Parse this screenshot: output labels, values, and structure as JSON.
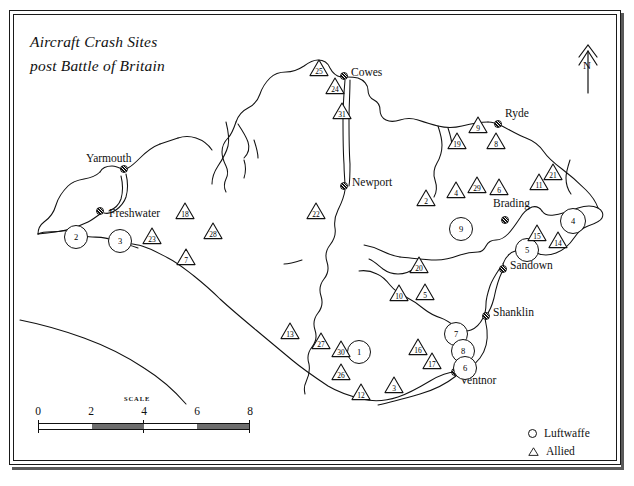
{
  "title": {
    "line1": "Aircraft Crash Sites",
    "line2": "post Battle of Britain"
  },
  "compass": {
    "label": "N",
    "icon": "north-arrow-icon"
  },
  "scale": {
    "caption": "SCALE",
    "ticks": [
      "0",
      "2",
      "4",
      "6",
      "8"
    ],
    "units": "miles"
  },
  "legend": {
    "items": [
      {
        "symbol": "circle",
        "label": "Luftwaffe"
      },
      {
        "symbol": "triangle",
        "label": "Allied"
      }
    ]
  },
  "towns": [
    {
      "name": "Yarmouth",
      "x": 124,
      "y": 169,
      "lx": 86,
      "ly": 152,
      "anchor": "left"
    },
    {
      "name": "Freshwater",
      "x": 100,
      "y": 211,
      "lx": 113,
      "ly": 213,
      "anchor": "left"
    },
    {
      "name": "Cowes",
      "x": 344,
      "y": 76,
      "lx": 355,
      "ly": 70,
      "anchor": "left"
    },
    {
      "name": "Newport",
      "x": 344,
      "y": 186,
      "lx": 356,
      "ly": 179,
      "anchor": "left"
    },
    {
      "name": "Ryde",
      "x": 498,
      "y": 124,
      "lx": 507,
      "ly": 110,
      "anchor": "left"
    },
    {
      "name": "Brading",
      "x": 505,
      "y": 220,
      "lx": 496,
      "ly": 200,
      "anchor": "left"
    },
    {
      "name": "Sandown",
      "x": 503,
      "y": 269,
      "lx": 513,
      "ly": 262,
      "anchor": "left"
    },
    {
      "name": "Shanklin",
      "x": 486,
      "y": 316,
      "lx": 495,
      "ly": 309,
      "anchor": "left"
    },
    {
      "name": "Ventnor",
      "x": 455,
      "y": 372,
      "lx": 463,
      "ly": 377,
      "anchor": "left"
    }
  ],
  "markers": {
    "luftwaffe_label": "Luftwaffe",
    "allied_label": "Allied",
    "circles": [
      {
        "id": "2",
        "x": 75,
        "y": 236,
        "r": 11
      },
      {
        "id": "3",
        "x": 119,
        "y": 240,
        "r": 11
      },
      {
        "id": "9",
        "x": 460,
        "y": 228,
        "r": 11
      },
      {
        "id": "4",
        "x": 572,
        "y": 220,
        "r": 12
      },
      {
        "id": "5",
        "x": 526,
        "y": 249,
        "r": 11
      },
      {
        "id": "1",
        "x": 358,
        "y": 351,
        "r": 11
      },
      {
        "id": "7",
        "x": 455,
        "y": 333,
        "r": 11
      },
      {
        "id": "8",
        "x": 462,
        "y": 350,
        "r": 11
      },
      {
        "id": "6",
        "x": 464,
        "y": 367,
        "r": 11
      }
    ],
    "triangles": [
      {
        "id": "25",
        "x": 319,
        "y": 68,
        "s": 20
      },
      {
        "id": "24",
        "x": 335,
        "y": 86,
        "s": 20
      },
      {
        "id": "31",
        "x": 342,
        "y": 111,
        "s": 20
      },
      {
        "id": "19",
        "x": 457,
        "y": 141,
        "s": 20
      },
      {
        "id": "9",
        "x": 478,
        "y": 125,
        "s": 20
      },
      {
        "id": "8",
        "x": 496,
        "y": 141,
        "s": 20
      },
      {
        "id": "22",
        "x": 316,
        "y": 211,
        "s": 20
      },
      {
        "id": "2",
        "x": 426,
        "y": 198,
        "s": 20
      },
      {
        "id": "4",
        "x": 456,
        "y": 190,
        "s": 20
      },
      {
        "id": "29",
        "x": 477,
        "y": 185,
        "s": 20
      },
      {
        "id": "6",
        "x": 499,
        "y": 187,
        "s": 20
      },
      {
        "id": "11",
        "x": 539,
        "y": 182,
        "s": 20
      },
      {
        "id": "21",
        "x": 553,
        "y": 172,
        "s": 20
      },
      {
        "id": "18",
        "x": 185,
        "y": 211,
        "s": 20
      },
      {
        "id": "28",
        "x": 213,
        "y": 231,
        "s": 20
      },
      {
        "id": "23",
        "x": 152,
        "y": 236,
        "s": 20
      },
      {
        "id": "7",
        "x": 186,
        "y": 257,
        "s": 20
      },
      {
        "id": "15",
        "x": 537,
        "y": 233,
        "s": 20
      },
      {
        "id": "14",
        "x": 558,
        "y": 240,
        "s": 20
      },
      {
        "id": "13",
        "x": 290,
        "y": 331,
        "s": 20
      },
      {
        "id": "27",
        "x": 321,
        "y": 341,
        "s": 20
      },
      {
        "id": "30",
        "x": 341,
        "y": 349,
        "s": 20
      },
      {
        "id": "26",
        "x": 341,
        "y": 372,
        "s": 20
      },
      {
        "id": "12",
        "x": 361,
        "y": 392,
        "s": 20
      },
      {
        "id": "3",
        "x": 394,
        "y": 385,
        "s": 20
      },
      {
        "id": "20",
        "x": 419,
        "y": 265,
        "s": 20
      },
      {
        "id": "10",
        "x": 399,
        "y": 293,
        "s": 20
      },
      {
        "id": "5",
        "x": 425,
        "y": 292,
        "s": 20
      },
      {
        "id": "16",
        "x": 418,
        "y": 347,
        "s": 20
      },
      {
        "id": "17",
        "x": 432,
        "y": 361,
        "s": 20
      }
    ]
  },
  "chart_data": {
    "type": "map",
    "title": "Aircraft Crash Sites post Battle of Britain",
    "region": "Isle of Wight",
    "series": [
      {
        "name": "Luftwaffe",
        "symbol": "circle",
        "count": 9,
        "values": [
          "1",
          "2",
          "3",
          "4",
          "5",
          "6",
          "7",
          "8",
          "9"
        ]
      },
      {
        "name": "Allied",
        "symbol": "triangle",
        "count": 30,
        "values": [
          "2",
          "3",
          "4",
          "5",
          "6",
          "7",
          "8",
          "9",
          "10",
          "11",
          "12",
          "13",
          "14",
          "15",
          "16",
          "17",
          "18",
          "19",
          "20",
          "21",
          "22",
          "23",
          "24",
          "25",
          "26",
          "27",
          "28",
          "29",
          "30",
          "31"
        ]
      }
    ],
    "scale_ticks": [
      "0",
      "2",
      "4",
      "6",
      "8"
    ],
    "place_labels": [
      "Yarmouth",
      "Freshwater",
      "Cowes",
      "Newport",
      "Ryde",
      "Brading",
      "Sandown",
      "Shanklin",
      "Ventnor"
    ]
  }
}
